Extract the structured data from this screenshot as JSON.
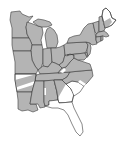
{
  "map": {
    "title": "Eastern United States range map",
    "colors": {
      "range_fill": "#b4b4b4",
      "outside_fill": "#ffffff",
      "border": "#3a3a3a",
      "background": "#ffffff"
    },
    "legend": {
      "shaded": "Species range",
      "unshaded": "Outside range"
    },
    "states": [
      {
        "id": "MN",
        "name": "Minnesota",
        "in_range": true
      },
      {
        "id": "WI",
        "name": "Wisconsin",
        "in_range": true
      },
      {
        "id": "MI",
        "name": "Michigan",
        "in_range": true
      },
      {
        "id": "IA",
        "name": "Iowa",
        "in_range": true
      },
      {
        "id": "IL",
        "name": "Illinois",
        "in_range": true
      },
      {
        "id": "IN",
        "name": "Indiana",
        "in_range": true
      },
      {
        "id": "OH",
        "name": "Ohio",
        "in_range": true
      },
      {
        "id": "MO",
        "name": "Missouri",
        "in_range": true
      },
      {
        "id": "KY",
        "name": "Kentucky",
        "in_range": true
      },
      {
        "id": "TN",
        "name": "Tennessee",
        "in_range": true
      },
      {
        "id": "AR",
        "name": "Arkansas",
        "in_range": "partial"
      },
      {
        "id": "LA",
        "name": "Louisiana",
        "in_range": true
      },
      {
        "id": "MS",
        "name": "Mississippi",
        "in_range": true
      },
      {
        "id": "AL",
        "name": "Alabama",
        "in_range": true
      },
      {
        "id": "GA",
        "name": "Georgia",
        "in_range": "partial"
      },
      {
        "id": "FL",
        "name": "Florida",
        "in_range": false
      },
      {
        "id": "SC",
        "name": "South Carolina",
        "in_range": false
      },
      {
        "id": "NC",
        "name": "North Carolina",
        "in_range": true
      },
      {
        "id": "VA",
        "name": "Virginia",
        "in_range": true
      },
      {
        "id": "WV",
        "name": "West Virginia",
        "in_range": true
      },
      {
        "id": "PA",
        "name": "Pennsylvania",
        "in_range": true
      },
      {
        "id": "NY",
        "name": "New York",
        "in_range": true
      },
      {
        "id": "NJ",
        "name": "New Jersey",
        "in_range": true
      },
      {
        "id": "MD",
        "name": "Maryland",
        "in_range": true
      },
      {
        "id": "DE",
        "name": "Delaware",
        "in_range": true
      },
      {
        "id": "CT",
        "name": "Connecticut",
        "in_range": true
      },
      {
        "id": "RI",
        "name": "Rhode Island",
        "in_range": true
      },
      {
        "id": "MA",
        "name": "Massachusetts",
        "in_range": true
      },
      {
        "id": "VT",
        "name": "Vermont",
        "in_range": true
      },
      {
        "id": "NH",
        "name": "New Hampshire",
        "in_range": true
      },
      {
        "id": "ME",
        "name": "Maine",
        "in_range": "partial"
      }
    ]
  }
}
